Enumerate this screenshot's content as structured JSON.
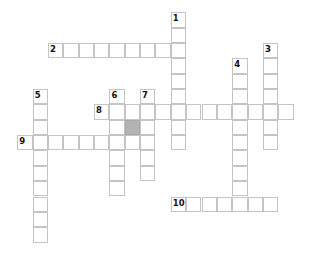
{
  "puzzle": {
    "cell_size": 15.35,
    "origin_x": 17.3,
    "origin_y": 12.3,
    "colors": {
      "border": "#c4c4c4",
      "block": "#b3b3b3",
      "number": "#111111"
    },
    "words": [
      {
        "number": "1",
        "direction": "down",
        "row": 0,
        "col": 10,
        "length": 9
      },
      {
        "number": "2",
        "direction": "across",
        "row": 2,
        "col": 2,
        "length": 9
      },
      {
        "number": "3",
        "direction": "down",
        "row": 2,
        "col": 16,
        "length": 7
      },
      {
        "number": "4",
        "direction": "down",
        "row": 3,
        "col": 14,
        "length": 10
      },
      {
        "number": "5",
        "direction": "down",
        "row": 5,
        "col": 1,
        "length": 10
      },
      {
        "number": "6",
        "direction": "down",
        "row": 5,
        "col": 6,
        "length": 7
      },
      {
        "number": "7",
        "direction": "down",
        "row": 5,
        "col": 8,
        "length": 6
      },
      {
        "number": "8",
        "direction": "across",
        "row": 6,
        "col": 5,
        "length": 13
      },
      {
        "number": "9",
        "direction": "across",
        "row": 8,
        "col": 0,
        "length": 9
      },
      {
        "number": "10",
        "direction": "across",
        "row": 12,
        "col": 10,
        "length": 7
      }
    ],
    "blocks": [
      {
        "row": 7,
        "col": 7
      }
    ]
  }
}
